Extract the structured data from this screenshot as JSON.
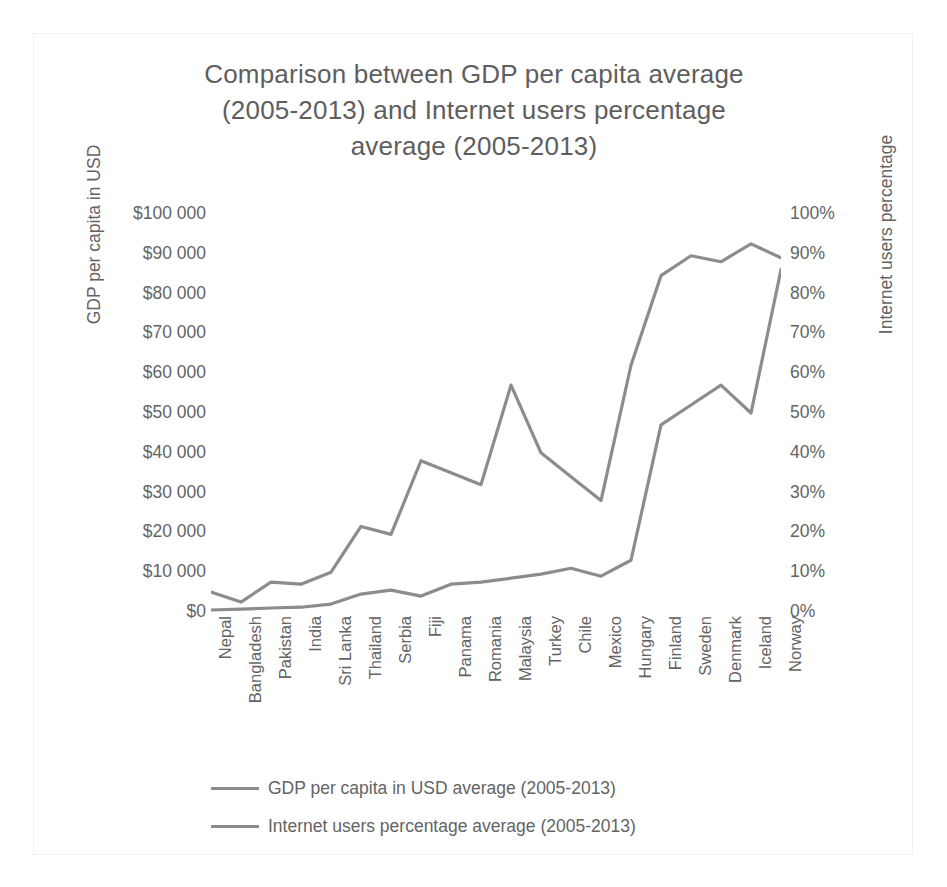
{
  "chart_data": {
    "type": "line",
    "title": "Comparison between GDP per capita average (2005-2013) and Internet users percentage average (2005-2013)",
    "title_lines": [
      "Comparison between GDP per capita average",
      "(2005-2013) and Internet users percentage",
      "average (2005-2013)"
    ],
    "xlabel": "",
    "ylabel_left": "GDP per capita in USD",
    "ylabel_right": "Internet users percentage",
    "ylim_left": [
      0,
      100000
    ],
    "ylim_right": [
      0,
      100
    ],
    "grid": false,
    "legend_position": "bottom-left",
    "line_color": "#8c8c8c",
    "text_color": "#646464",
    "background": "#ffffff",
    "categories": [
      "Nepal",
      "Bangladesh",
      "Pakistan",
      "India",
      "Sri Lanka",
      "Thailand",
      "Serbia",
      "Fiji",
      "Panama",
      "Romania",
      "Malaysia",
      "Turkey",
      "Chile",
      "Mexico",
      "Hungary",
      "Finland",
      "Sweden",
      "Denmark",
      "Iceland",
      "Norway"
    ],
    "left_ticks": [
      "$100 000",
      "$90 000",
      "$80 000",
      "$70 000",
      "$60 000",
      "$50 000",
      "$40 000",
      "$30 000",
      "$20 000",
      "$10 000",
      "$0"
    ],
    "left_tick_values": [
      100000,
      90000,
      80000,
      70000,
      60000,
      50000,
      40000,
      30000,
      20000,
      10000,
      0
    ],
    "right_ticks": [
      "100%",
      "90%",
      "80%",
      "70%",
      "60%",
      "50%",
      "40%",
      "30%",
      "20%",
      "10%",
      "0%"
    ],
    "right_tick_values": [
      100,
      90,
      80,
      70,
      60,
      50,
      40,
      30,
      20,
      10,
      0
    ],
    "series": [
      {
        "name": "GDP per capita in USD average (2005-2013)",
        "axis": "left",
        "unit": "USD",
        "values": [
          500,
          700,
          1000,
          1200,
          2000,
          4500,
          5500,
          4000,
          7000,
          7500,
          8500,
          9500,
          11000,
          9000,
          13000,
          47000,
          52000,
          57000,
          50000,
          86000
        ]
      },
      {
        "name": "Internet users percentage average (2005-2013)",
        "axis": "right",
        "unit": "%",
        "values": [
          5,
          2.5,
          7.5,
          7,
          10,
          21.5,
          19.5,
          38,
          35,
          32,
          57,
          40,
          34,
          28,
          62,
          84.5,
          89.5,
          88,
          92.5,
          89
        ]
      }
    ],
    "legend": [
      "GDP per capita in USD average (2005-2013)",
      "Internet users percentage average (2005-2013)"
    ]
  }
}
